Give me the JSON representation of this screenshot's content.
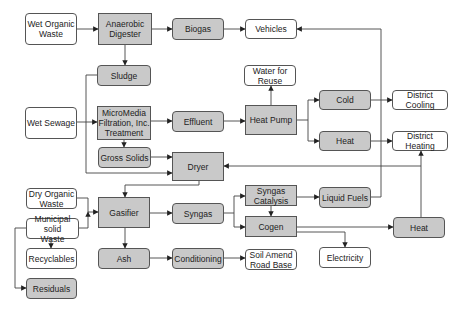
{
  "diagram": {
    "colors": {
      "process_fill": "#c9c9c9",
      "output_fill": "#ffffff",
      "stroke": "#555555"
    },
    "nodes": [
      {
        "id": "wet-organic-waste",
        "label": "Wet Organic\nWaste",
        "x": 25,
        "y": 13,
        "w": 52,
        "h": 32,
        "fill": "white",
        "shape": "round"
      },
      {
        "id": "anaerobic-digester",
        "label": "Anaerobic\nDigester",
        "x": 98,
        "y": 13,
        "w": 54,
        "h": 32,
        "fill": "gray",
        "shape": "square"
      },
      {
        "id": "biogas",
        "label": "Biogas",
        "x": 172,
        "y": 18,
        "w": 52,
        "h": 22,
        "fill": "gray",
        "shape": "round"
      },
      {
        "id": "vehicles",
        "label": "Vehicles",
        "x": 245,
        "y": 19,
        "w": 52,
        "h": 20,
        "fill": "white",
        "shape": "round"
      },
      {
        "id": "sludge",
        "label": "Sludge",
        "x": 97,
        "y": 65,
        "w": 54,
        "h": 21,
        "fill": "gray",
        "shape": "round"
      },
      {
        "id": "water-for-reuse",
        "label": "Water for\nReuse",
        "x": 244,
        "y": 65,
        "w": 52,
        "h": 21,
        "fill": "white",
        "shape": "round"
      },
      {
        "id": "wet-sewage",
        "label": "Wet Sewage",
        "x": 25,
        "y": 107,
        "w": 52,
        "h": 32,
        "fill": "white",
        "shape": "round"
      },
      {
        "id": "micromedia",
        "label": "MicroMedia\nFiltration, Inc.\nTreatment",
        "x": 97,
        "y": 106,
        "w": 54,
        "h": 34,
        "fill": "gray",
        "shape": "square"
      },
      {
        "id": "effluent",
        "label": "Effluent",
        "x": 172,
        "y": 111,
        "w": 52,
        "h": 21,
        "fill": "gray",
        "shape": "round"
      },
      {
        "id": "heat-pump",
        "label": "Heat Pump",
        "x": 245,
        "y": 105,
        "w": 52,
        "h": 30,
        "fill": "gray",
        "shape": "square"
      },
      {
        "id": "cold",
        "label": "Cold",
        "x": 319,
        "y": 90,
        "w": 52,
        "h": 20,
        "fill": "gray",
        "shape": "round"
      },
      {
        "id": "district-cooling",
        "label": "District Cooling",
        "x": 392,
        "y": 90,
        "w": 56,
        "h": 20,
        "fill": "white",
        "shape": "round"
      },
      {
        "id": "heat-top",
        "label": "Heat",
        "x": 319,
        "y": 131,
        "w": 52,
        "h": 20,
        "fill": "gray",
        "shape": "round"
      },
      {
        "id": "district-heating",
        "label": "District Heating",
        "x": 392,
        "y": 131,
        "w": 56,
        "h": 20,
        "fill": "white",
        "shape": "round"
      },
      {
        "id": "gross-solids",
        "label": "Gross Solids",
        "x": 98,
        "y": 147,
        "w": 53,
        "h": 21,
        "fill": "gray",
        "shape": "round"
      },
      {
        "id": "dryer",
        "label": "Dryer",
        "x": 172,
        "y": 152,
        "w": 52,
        "h": 29,
        "fill": "gray",
        "shape": "square"
      },
      {
        "id": "dry-organic-waste",
        "label": "Dry Organic\nWaste",
        "x": 26,
        "y": 188,
        "w": 51,
        "h": 21,
        "fill": "white",
        "shape": "round"
      },
      {
        "id": "municipal-solid-waste",
        "label": "Municipal solid\nWaste",
        "x": 26,
        "y": 218,
        "w": 53,
        "h": 21,
        "fill": "white",
        "shape": "round"
      },
      {
        "id": "gasifier",
        "label": "Gasifier",
        "x": 98,
        "y": 197,
        "w": 52,
        "h": 31,
        "fill": "gray",
        "shape": "square"
      },
      {
        "id": "syngas",
        "label": "Syngas",
        "x": 172,
        "y": 203,
        "w": 52,
        "h": 21,
        "fill": "gray",
        "shape": "round"
      },
      {
        "id": "syngas-catalysis",
        "label": "Syngas\nCatalysis",
        "x": 245,
        "y": 185,
        "w": 52,
        "h": 21,
        "fill": "gray",
        "shape": "square"
      },
      {
        "id": "liquid-fuels",
        "label": "Liquid Fuels",
        "x": 319,
        "y": 187,
        "w": 52,
        "h": 21,
        "fill": "gray",
        "shape": "round"
      },
      {
        "id": "cogen",
        "label": "Cogen",
        "x": 245,
        "y": 216,
        "w": 52,
        "h": 21,
        "fill": "gray",
        "shape": "square"
      },
      {
        "id": "heat-bottom",
        "label": "Heat",
        "x": 393,
        "y": 217,
        "w": 52,
        "h": 21,
        "fill": "gray",
        "shape": "round"
      },
      {
        "id": "recyclables",
        "label": "Recyclables",
        "x": 26,
        "y": 248,
        "w": 51,
        "h": 21,
        "fill": "white",
        "shape": "round"
      },
      {
        "id": "ash",
        "label": "Ash",
        "x": 98,
        "y": 248,
        "w": 52,
        "h": 21,
        "fill": "gray",
        "shape": "round"
      },
      {
        "id": "conditioning",
        "label": "Conditioning",
        "x": 172,
        "y": 248,
        "w": 52,
        "h": 21,
        "fill": "gray",
        "shape": "round"
      },
      {
        "id": "soil-amend-road-base",
        "label": "Soil Amend\nRoad Base",
        "x": 245,
        "y": 249,
        "w": 52,
        "h": 21,
        "fill": "white",
        "shape": "round"
      },
      {
        "id": "electricity",
        "label": "Electricity",
        "x": 319,
        "y": 247,
        "w": 52,
        "h": 21,
        "fill": "white",
        "shape": "round"
      },
      {
        "id": "residuals",
        "label": "Residuals",
        "x": 26,
        "y": 278,
        "w": 51,
        "h": 21,
        "fill": "gray",
        "shape": "round"
      }
    ],
    "edges": [
      {
        "from": "wet-organic-waste",
        "to": "anaerobic-digester",
        "points": [
          [
            77,
            29
          ],
          [
            98,
            29
          ]
        ]
      },
      {
        "from": "anaerobic-digester",
        "to": "biogas",
        "points": [
          [
            152,
            29
          ],
          [
            172,
            29
          ]
        ]
      },
      {
        "from": "biogas",
        "to": "vehicles",
        "points": [
          [
            224,
            29
          ],
          [
            245,
            29
          ]
        ]
      },
      {
        "from": "anaerobic-digester",
        "to": "sludge",
        "points": [
          [
            125,
            45
          ],
          [
            125,
            65
          ]
        ]
      },
      {
        "from": "sludge",
        "to": "dryer",
        "points": [
          [
            97,
            75
          ],
          [
            86,
            75
          ],
          [
            86,
            173
          ],
          [
            172,
            173
          ]
        ]
      },
      {
        "from": "wet-sewage",
        "to": "micromedia",
        "points": [
          [
            77,
            122
          ],
          [
            97,
            122
          ]
        ]
      },
      {
        "from": "micromedia",
        "to": "effluent",
        "points": [
          [
            151,
            121
          ],
          [
            172,
            121
          ]
        ]
      },
      {
        "from": "micromedia",
        "to": "gross-solids",
        "points": [
          [
            124,
            140
          ],
          [
            124,
            147
          ]
        ]
      },
      {
        "from": "effluent",
        "to": "heat-pump",
        "points": [
          [
            224,
            121
          ],
          [
            245,
            121
          ]
        ]
      },
      {
        "from": "heat-pump",
        "to": "water-for-reuse",
        "points": [
          [
            271,
            105
          ],
          [
            271,
            86
          ]
        ]
      },
      {
        "from": "heat-pump",
        "to": "cold",
        "points": [
          [
            297,
            120
          ],
          [
            308,
            120
          ],
          [
            308,
            100
          ],
          [
            319,
            100
          ]
        ]
      },
      {
        "from": "heat-pump",
        "to": "heat-top",
        "points": [
          [
            308,
            120
          ],
          [
            308,
            141
          ],
          [
            319,
            141
          ]
        ]
      },
      {
        "from": "cold",
        "to": "district-cooling",
        "points": [
          [
            371,
            100
          ],
          [
            392,
            100
          ]
        ]
      },
      {
        "from": "heat-top",
        "to": "district-heating",
        "points": [
          [
            371,
            141
          ],
          [
            392,
            141
          ]
        ]
      },
      {
        "from": "gross-solids",
        "to": "dryer",
        "points": [
          [
            151,
            157
          ],
          [
            172,
            157
          ]
        ]
      },
      {
        "from": "dryer",
        "to": "gasifier",
        "points": [
          [
            199,
            181
          ],
          [
            199,
            185
          ],
          [
            125,
            185
          ],
          [
            125,
            197
          ]
        ]
      },
      {
        "from": "dry-organic-waste",
        "to": "gasifier",
        "points": [
          [
            77,
            198
          ],
          [
            88,
            198
          ],
          [
            88,
            212
          ],
          [
            98,
            212
          ]
        ]
      },
      {
        "from": "municipal-solid-waste",
        "to": "gasifier",
        "points": [
          [
            79,
            228
          ],
          [
            88,
            228
          ],
          [
            88,
            212
          ]
        ]
      },
      {
        "from": "municipal-solid-waste",
        "to": "recyclables",
        "points": [
          [
            51,
            239
          ],
          [
            51,
            248
          ]
        ]
      },
      {
        "from": "municipal-solid-waste",
        "to": "residuals",
        "points": [
          [
            26,
            228
          ],
          [
            15,
            228
          ],
          [
            15,
            288
          ],
          [
            26,
            288
          ]
        ]
      },
      {
        "from": "gasifier",
        "to": "syngas",
        "points": [
          [
            150,
            213
          ],
          [
            172,
            213
          ]
        ]
      },
      {
        "from": "gasifier",
        "to": "ash",
        "points": [
          [
            125,
            228
          ],
          [
            125,
            248
          ]
        ]
      },
      {
        "from": "syngas",
        "to": "syngas-catalysis",
        "points": [
          [
            224,
            213
          ],
          [
            234,
            213
          ],
          [
            234,
            196
          ],
          [
            245,
            196
          ]
        ]
      },
      {
        "from": "syngas",
        "to": "cogen",
        "points": [
          [
            234,
            213
          ],
          [
            234,
            227
          ],
          [
            245,
            227
          ]
        ]
      },
      {
        "from": "syngas-catalysis",
        "to": "cogen",
        "points": [
          [
            271,
            206
          ],
          [
            271,
            216
          ]
        ]
      },
      {
        "from": "syngas-catalysis",
        "to": "liquid-fuels",
        "points": [
          [
            297,
            197
          ],
          [
            319,
            197
          ]
        ]
      },
      {
        "from": "liquid-fuels",
        "to": "vehicles",
        "points": [
          [
            371,
            197
          ],
          [
            381,
            197
          ],
          [
            381,
            29
          ],
          [
            297,
            29
          ]
        ]
      },
      {
        "from": "cogen",
        "to": "heat-bottom",
        "points": [
          [
            297,
            227
          ],
          [
            393,
            227
          ]
        ]
      },
      {
        "from": "cogen",
        "to": "electricity",
        "points": [
          [
            297,
            232
          ],
          [
            345,
            232
          ],
          [
            345,
            247
          ]
        ]
      },
      {
        "from": "heat-bottom",
        "to": "district-heating",
        "points": [
          [
            421,
            217
          ],
          [
            421,
            151
          ]
        ]
      },
      {
        "from": "heat-bottom",
        "to": "dryer",
        "points": [
          [
            421,
            166
          ],
          [
            224,
            166
          ]
        ]
      },
      {
        "from": "ash",
        "to": "conditioning",
        "points": [
          [
            150,
            258
          ],
          [
            172,
            258
          ]
        ]
      },
      {
        "from": "conditioning",
        "to": "soil-amend-road-base",
        "points": [
          [
            224,
            258
          ],
          [
            245,
            258
          ]
        ]
      }
    ]
  }
}
